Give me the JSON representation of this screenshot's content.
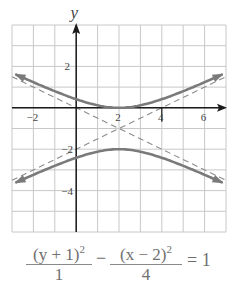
{
  "chart_data": {
    "type": "line",
    "title": "",
    "xlabel": "",
    "ylabel": "y",
    "xlim": [
      -3,
      7
    ],
    "ylim": [
      -6,
      4
    ],
    "grid": true,
    "x_ticks": [
      {
        "value": -2,
        "label": "−2"
      },
      {
        "value": 2,
        "label": "2"
      },
      {
        "value": 4,
        "label": "4"
      },
      {
        "value": 6,
        "label": "6"
      }
    ],
    "y_ticks": [
      {
        "value": 2,
        "label": "2"
      },
      {
        "value": -2,
        "label": "−2"
      },
      {
        "value": -4,
        "label": "−4"
      }
    ],
    "hyperbola": {
      "center": [
        2,
        -1
      ],
      "a": 1,
      "b": 2,
      "orientation": "vertical",
      "vertices": [
        [
          2,
          0
        ],
        [
          2,
          -2
        ]
      ]
    },
    "series": [
      {
        "name": "upper branch",
        "style": "solid",
        "color": "#7a7a7a",
        "x": [
          -3,
          -2,
          -1,
          0,
          1,
          2,
          3,
          4,
          5,
          6,
          7
        ],
        "values": [
          1.69,
          1.24,
          0.8,
          0.41,
          0.12,
          0.0,
          0.12,
          0.41,
          0.8,
          1.24,
          1.69
        ]
      },
      {
        "name": "lower branch",
        "style": "solid",
        "color": "#7a7a7a",
        "x": [
          -3,
          -2,
          -1,
          0,
          1,
          2,
          3,
          4,
          5,
          6,
          7
        ],
        "values": [
          -3.69,
          -3.24,
          -2.8,
          -2.41,
          -2.12,
          -2.0,
          -2.12,
          -2.41,
          -2.8,
          -3.24,
          -3.69
        ]
      },
      {
        "name": "asymptote y+1=(x-2)/2",
        "style": "dashed",
        "color": "#8c8c8c",
        "x": [
          -3,
          7
        ],
        "values": [
          -3.5,
          1.5
        ]
      },
      {
        "name": "asymptote y+1=-(x-2)/2",
        "style": "dashed",
        "color": "#8c8c8c",
        "x": [
          -3,
          7
        ],
        "values": [
          1.5,
          -3.5
        ]
      }
    ]
  },
  "equation": {
    "term1_num": "(y + 1)",
    "term1_exp": "2",
    "term1_den": "1",
    "minus": "−",
    "term2_num": "(x − 2)",
    "term2_exp": "2",
    "term2_den": "4",
    "rhs": "= 1"
  },
  "colors": {
    "grid": "#c8c8c8",
    "axis": "#1a1a1a",
    "curve": "#7a7a7a",
    "asymptote": "#8c8c8c",
    "text": "#6f6f6f"
  }
}
